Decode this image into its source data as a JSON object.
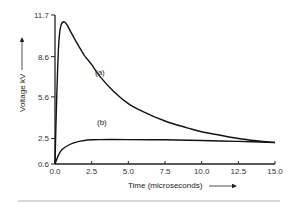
{
  "chart_data": {
    "type": "line",
    "title": "",
    "xlabel": "Time (microseconds)",
    "ylabel": "Voltage kV",
    "xlim": [
      0.0,
      15.0
    ],
    "ylim": [
      0.6,
      11.7
    ],
    "x_ticks": [
      "0.0",
      "2.5",
      "5.0",
      "7.5",
      "10.0",
      "12.5",
      "15.0"
    ],
    "y_ticks": [
      "0.6",
      "2.5",
      "5.6",
      "8.6",
      "11.7"
    ],
    "grid": false,
    "legend": "inline curve labels",
    "series": [
      {
        "name": "(a)",
        "x": [
          0.0,
          0.1,
          0.25,
          0.4,
          0.6,
          0.8,
          1.0,
          1.5,
          2.0,
          2.5,
          3.0,
          4.0,
          5.0,
          6.0,
          7.5,
          9.0,
          10.0,
          11.0,
          12.5,
          14.0,
          15.0
        ],
        "values": [
          0.6,
          5.0,
          9.5,
          10.9,
          11.2,
          11.0,
          10.6,
          9.6,
          8.7,
          8.0,
          7.2,
          6.0,
          5.1,
          4.5,
          3.8,
          3.3,
          3.0,
          2.8,
          2.5,
          2.3,
          2.2
        ]
      },
      {
        "name": "(b)",
        "x": [
          0.0,
          0.25,
          0.5,
          1.0,
          1.5,
          2.0,
          2.5,
          3.0,
          5.0,
          7.5,
          10.0,
          12.5,
          15.0
        ],
        "values": [
          0.6,
          1.3,
          1.7,
          2.05,
          2.25,
          2.35,
          2.4,
          2.42,
          2.42,
          2.4,
          2.35,
          2.28,
          2.2
        ]
      }
    ],
    "annotations": [
      {
        "text": "(a)",
        "x": 2.7,
        "y": 6.6
      },
      {
        "text": "(b)",
        "x": 2.9,
        "y": 2.9
      }
    ]
  },
  "labels": {
    "xlabel": "Time (microseconds)",
    "ylabel": "Voltage kV",
    "curve_a": "(a)",
    "curve_b": "(b)",
    "x_ticks": [
      "0.0",
      "2.5",
      "5.0",
      "7.5",
      "10.0",
      "12.5",
      "15.0"
    ],
    "y_ticks": [
      "0.6",
      "2.5",
      "5.6",
      "8.6",
      "11.7"
    ]
  }
}
